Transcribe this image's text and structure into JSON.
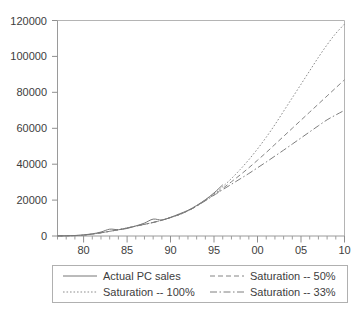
{
  "chart_data": {
    "type": "line",
    "title": "",
    "subtitle": "",
    "xlabel": "",
    "ylabel": "",
    "xlim": [
      1977,
      2010
    ],
    "ylim": [
      0,
      120000
    ],
    "grid": false,
    "legend_position": "bottom",
    "y_ticks": [
      0,
      20000,
      40000,
      60000,
      80000,
      100000,
      120000
    ],
    "y_tick_labels": [
      "0",
      "20000",
      "40000",
      "60000",
      "80000",
      "100000",
      "120000"
    ],
    "x_ticks": [
      1980,
      1985,
      1990,
      1995,
      2000,
      2005,
      2010
    ],
    "x_tick_labels": [
      "80",
      "85",
      "90",
      "95",
      "00",
      "05",
      "10"
    ],
    "x_minor_tick_step": 1,
    "series": [
      {
        "name": "Actual PC sales",
        "style": "solid",
        "x": [
          1977,
          1978,
          1979,
          1980,
          1981,
          1982,
          1983,
          1984,
          1985,
          1986,
          1987,
          1988,
          1989,
          1990,
          1991,
          1992,
          1993,
          1994,
          1995,
          1996
        ],
        "values": [
          50,
          120,
          280,
          600,
          1200,
          2200,
          3800,
          3500,
          4200,
          5600,
          7200,
          9400,
          8900,
          10400,
          12300,
          14300,
          17000,
          20200,
          24000,
          28500
        ]
      },
      {
        "name": "Saturation -- 100%",
        "style": "dotted",
        "x": [
          1977,
          1980,
          1983,
          1986,
          1989,
          1992,
          1995,
          1996,
          1997,
          1998,
          1999,
          2000,
          2001,
          2002,
          2003,
          2004,
          2005,
          2006,
          2007,
          2008,
          2009,
          2010
        ],
        "values": [
          40,
          500,
          2600,
          5500,
          8800,
          14000,
          23500,
          27500,
          32000,
          37000,
          42500,
          48500,
          55000,
          62000,
          69500,
          77000,
          84500,
          92000,
          99500,
          106500,
          112800,
          118000
        ]
      },
      {
        "name": "Saturation -- 50%",
        "style": "dashed",
        "x": [
          1977,
          1980,
          1983,
          1986,
          1989,
          1992,
          1995,
          1996,
          1997,
          1998,
          1999,
          2000,
          2001,
          2002,
          2003,
          2004,
          2005,
          2006,
          2007,
          2008,
          2009,
          2010
        ],
        "values": [
          40,
          500,
          2600,
          5500,
          8800,
          14000,
          23000,
          26500,
          30200,
          34000,
          38000,
          42200,
          46500,
          51000,
          55500,
          60000,
          64500,
          69000,
          73500,
          78000,
          82500,
          87000
        ]
      },
      {
        "name": "Saturation -- 33%",
        "style": "dash-dot",
        "x": [
          1977,
          1980,
          1983,
          1986,
          1989,
          1992,
          1995,
          1996,
          1997,
          1998,
          1999,
          2000,
          2001,
          2002,
          2003,
          2004,
          2005,
          2006,
          2007,
          2008,
          2009,
          2010
        ],
        "values": [
          40,
          500,
          2600,
          5500,
          8800,
          14000,
          22700,
          25800,
          28800,
          31800,
          34800,
          38000,
          41200,
          44500,
          47800,
          51200,
          54600,
          58000,
          61400,
          64700,
          67400,
          70000
        ]
      }
    ]
  },
  "legend": {
    "entries": [
      {
        "label": "Actual PC sales",
        "style": "solid"
      },
      {
        "label": "Saturation -- 50%",
        "style": "dashed"
      },
      {
        "label": "Saturation -- 100%",
        "style": "dotted"
      },
      {
        "label": "Saturation -- 33%",
        "style": "dash-dot"
      }
    ]
  },
  "colors": {
    "background": "#ffffff",
    "ink": "#3d3d3d",
    "frame": "#b4b4b4",
    "series": "#808080"
  }
}
